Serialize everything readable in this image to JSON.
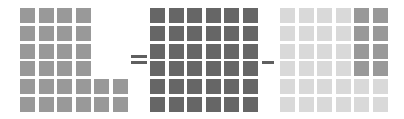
{
  "diagram": {
    "type": "grid-equation",
    "rows": 6,
    "columns": 6,
    "cell_size_px": 15,
    "colors": {
      "medium_gray": "#999999",
      "dark_gray": "#666666",
      "light_gray": "#d9d9d9",
      "operator_gray": "#5f5f5f",
      "background": "#ffffff"
    },
    "operators": [
      {
        "name": "equals",
        "symbol": "="
      },
      {
        "name": "minus",
        "symbol": "−"
      }
    ],
    "grids": [
      {
        "name": "minuend-result-l-shape",
        "label": "L-shaped grid",
        "filled_count": 28,
        "cells": [
          [
            "mid",
            "mid",
            "mid",
            "mid",
            "empty",
            "empty"
          ],
          [
            "mid",
            "mid",
            "mid",
            "mid",
            "empty",
            "empty"
          ],
          [
            "mid",
            "mid",
            "mid",
            "mid",
            "empty",
            "empty"
          ],
          [
            "mid",
            "mid",
            "mid",
            "mid",
            "empty",
            "empty"
          ],
          [
            "mid",
            "mid",
            "mid",
            "mid",
            "mid",
            "mid"
          ],
          [
            "mid",
            "mid",
            "mid",
            "mid",
            "mid",
            "mid"
          ]
        ]
      },
      {
        "name": "full-grid",
        "label": "Full 6 by 6 grid",
        "filled_count": 36,
        "cells": [
          [
            "dark",
            "dark",
            "dark",
            "dark",
            "dark",
            "dark"
          ],
          [
            "dark",
            "dark",
            "dark",
            "dark",
            "dark",
            "dark"
          ],
          [
            "dark",
            "dark",
            "dark",
            "dark",
            "dark",
            "dark"
          ],
          [
            "dark",
            "dark",
            "dark",
            "dark",
            "dark",
            "dark"
          ],
          [
            "dark",
            "dark",
            "dark",
            "dark",
            "dark",
            "dark"
          ],
          [
            "dark",
            "dark",
            "dark",
            "dark",
            "dark",
            "dark"
          ]
        ]
      },
      {
        "name": "subtrahend-grid",
        "label": "Grid with highlighted corner block",
        "filled_count": 36,
        "highlighted_count": 8,
        "cells": [
          [
            "light",
            "light",
            "light",
            "light",
            "mid",
            "mid"
          ],
          [
            "light",
            "light",
            "light",
            "light",
            "mid",
            "mid"
          ],
          [
            "light",
            "light",
            "light",
            "light",
            "mid",
            "mid"
          ],
          [
            "light",
            "light",
            "light",
            "light",
            "mid",
            "mid"
          ],
          [
            "light",
            "light",
            "light",
            "light",
            "light",
            "light"
          ],
          [
            "light",
            "light",
            "light",
            "light",
            "light",
            "light"
          ]
        ]
      }
    ]
  }
}
